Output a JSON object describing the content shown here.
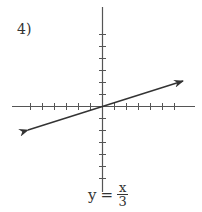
{
  "problem": {
    "number": "4)"
  },
  "equation": {
    "lhs": "y",
    "equals": "=",
    "numerator": "x",
    "denominator": "3"
  },
  "colors": {
    "axis": "#555555",
    "line": "#333333",
    "text": "#333333"
  },
  "graph": {
    "origin": [
      102,
      106
    ],
    "tick_spacing_px": 12,
    "x_ticks_each_side": 6,
    "y_ticks_each_side": 6,
    "x_axis_range_px": [
      12,
      195
    ],
    "y_axis_range_px": [
      7,
      192
    ],
    "line": {
      "slope": 0.3333,
      "intercept": 0,
      "arrow_start": [
        28,
        130
      ],
      "arrow_end": [
        183,
        81
      ]
    }
  }
}
